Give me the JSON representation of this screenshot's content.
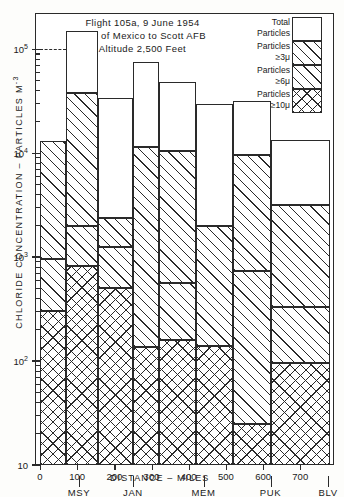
{
  "title": {
    "line1": "Flight 105a,  9 June 1954",
    "line2": "Gulf of Mexico to Scott  AFB",
    "line3": "Altitude 2,500 Feet"
  },
  "axes": {
    "ylabel": "CHLORIDE CONCENTRATION – PARTICLES  M",
    "ylabel_exponent": "-3",
    "xlabel": "DISTANCE – MILES",
    "ytick_labels": [
      "10",
      "10",
      "10",
      "10",
      "10"
    ],
    "ytick_exponents": [
      "5",
      "4",
      "3",
      "2",
      ""
    ],
    "ytick_values": [
      100000,
      10000,
      1000,
      100,
      10
    ],
    "xtick_labels": [
      "0",
      "100",
      "200",
      "300",
      "400",
      "500",
      "600",
      "700"
    ],
    "xtick_values": [
      0,
      100,
      200,
      300,
      400,
      500,
      600,
      700
    ]
  },
  "cities": [
    {
      "label": "MSY",
      "mile": 105
    },
    {
      "label": "JAN",
      "mile": 250
    },
    {
      "label": "MEM",
      "mile": 440
    },
    {
      "label": "PUK",
      "mile": 620
    },
    {
      "label": "BLV",
      "mile": 775
    }
  ],
  "legend": {
    "items": [
      {
        "label_line1": "Total",
        "label_line2": "Particles",
        "pattern": "p-none",
        "arrow": "⤵"
      },
      {
        "label_line1": "Particles",
        "label_line2": "≥3μ",
        "pattern": "p-d1",
        "arrow": "⤵"
      },
      {
        "label_line1": "Particles",
        "label_line2": "≥6μ",
        "pattern": "p-d2",
        "arrow": "⤵"
      },
      {
        "label_line1": "Particles",
        "label_line2": "≥10μ",
        "pattern": "p-x",
        "arrow": "⤵"
      }
    ]
  },
  "chart_data": {
    "type": "bar",
    "subtype": "stacked-step-histogram",
    "xlabel": "DISTANCE – MILES",
    "ylabel": "CHLORIDE CONCENTRATION – PARTICLES M-3",
    "yscale": "log",
    "ylim": [
      10,
      200000
    ],
    "xlim": [
      0,
      780
    ],
    "grid": false,
    "legend_position": "top-right",
    "series_names": [
      "Total Particles",
      "Particles ≥3μ",
      "Particles ≥6μ",
      "Particles ≥10μ"
    ],
    "bins": [
      {
        "x_start": 0,
        "x_end": 70,
        "total": 13000,
        "ge3": 13000,
        "ge6": 950,
        "ge10": 300
      },
      {
        "x_start": 70,
        "x_end": 155,
        "total": 150000,
        "ge3": 38000,
        "ge6": 2000,
        "ge10": 820
      },
      {
        "x_start": 155,
        "x_end": 250,
        "total": 34000,
        "ge3": 2400,
        "ge6": 1250,
        "ge10": 500
      },
      {
        "x_start": 250,
        "x_end": 320,
        "total": 75000,
        "ge3": 11500,
        "ge6": 11500,
        "ge10": 135
      },
      {
        "x_start": 320,
        "x_end": 420,
        "total": 48000,
        "ge3": 10500,
        "ge6": 560,
        "ge10": 160
      },
      {
        "x_start": 420,
        "x_end": 520,
        "total": 30000,
        "ge3": 2000,
        "ge6": 2000,
        "ge10": 140
      },
      {
        "x_start": 520,
        "x_end": 620,
        "total": 32000,
        "ge3": 9500,
        "ge6": 740,
        "ge10": 25
      },
      {
        "x_start": 620,
        "x_end": 780,
        "total": 13500,
        "ge3": 3200,
        "ge6": 330,
        "ge10": 95
      }
    ],
    "reference_line": {
      "y": 100000,
      "style": "dashed",
      "x_start": 0,
      "x_end": 70
    }
  }
}
